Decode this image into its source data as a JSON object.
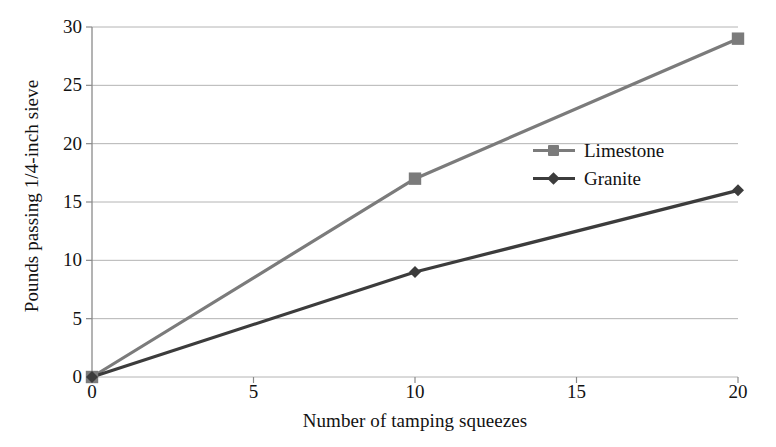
{
  "chart_data": {
    "type": "line",
    "title": "",
    "xlabel": "Number of tamping squeezes",
    "ylabel": "Pounds passing 1/4-inch sieve",
    "xlim": [
      0,
      20
    ],
    "ylim": [
      0,
      30
    ],
    "xticks": [
      "0",
      "5",
      "10",
      "15",
      "20"
    ],
    "yticks": [
      "0",
      "5",
      "10",
      "15",
      "20",
      "25",
      "30"
    ],
    "grid": "horizontal",
    "legend_position": "center-right",
    "x": [
      0,
      10,
      20
    ],
    "series": [
      {
        "name": "Limestone",
        "values": [
          0,
          17,
          29
        ],
        "color": "#7b7b7b",
        "marker": "square"
      },
      {
        "name": "Granite",
        "values": [
          0,
          9,
          16
        ],
        "color": "#3c3c3c",
        "marker": "diamond"
      }
    ]
  },
  "legend": {
    "items": [
      {
        "label": "Limestone"
      },
      {
        "label": "Granite"
      }
    ]
  },
  "axes": {
    "axis_color": "#8a8a8a",
    "grid_color": "#b4b4b4",
    "text_color": "#121212"
  }
}
